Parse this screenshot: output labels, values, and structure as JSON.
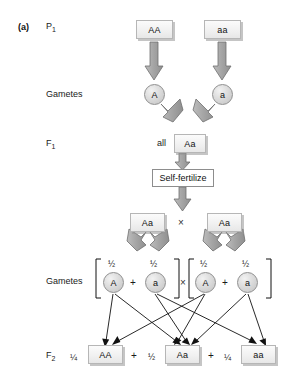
{
  "figure": {
    "panel_label": "(a)",
    "type": "monohybrid-cross-diagram"
  },
  "row_labels": {
    "p1": "P",
    "p1_sub": "1",
    "gametes_1": "Gametes",
    "f1": "F",
    "f1_sub": "1",
    "gametes_2": "Gametes",
    "f2": "F",
    "f2_sub": "2"
  },
  "p_generation": {
    "parent_left": "AA",
    "parent_right": "aa"
  },
  "gametes_p": {
    "left": "A",
    "right": "a"
  },
  "f1_generation": {
    "prefix": "all",
    "genotype": "Aa"
  },
  "self_fertilize": {
    "label": "Self-fertilize"
  },
  "f1_cross": {
    "left": "Aa",
    "operator": "×",
    "right": "Aa"
  },
  "gametes_f1": {
    "cross_operator": "×",
    "plus": "+",
    "left_parent": [
      {
        "fraction": "½",
        "allele": "A"
      },
      {
        "fraction": "½",
        "allele": "a"
      }
    ],
    "right_parent": [
      {
        "fraction": "½",
        "allele": "A"
      },
      {
        "fraction": "½",
        "allele": "a"
      }
    ]
  },
  "f2_generation": {
    "plus_1": "+",
    "plus_2": "+",
    "outcomes": [
      {
        "ratio": "¼",
        "genotype": "AA"
      },
      {
        "ratio": "½",
        "genotype": "Aa"
      },
      {
        "ratio": "¼",
        "genotype": "aa"
      }
    ]
  },
  "colors": {
    "block_arrow_fill": "#a8a8a8",
    "block_arrow_stroke": "#6e6e6e",
    "thin_arrow": "#111111",
    "box_fill": "#f1f1f1",
    "box_border": "#b6b6b6",
    "text": "#111111"
  }
}
